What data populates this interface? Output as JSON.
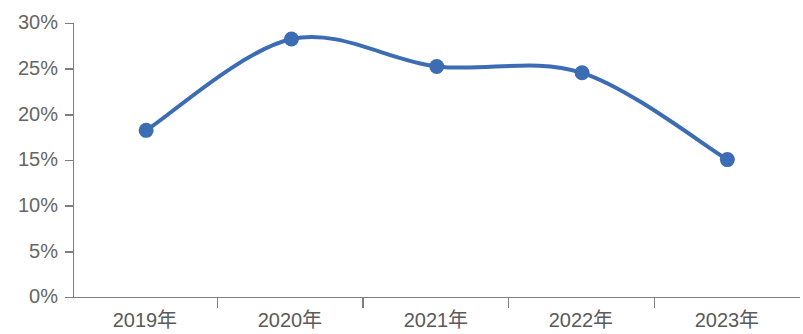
{
  "chart_data": {
    "type": "line",
    "title": "",
    "subtitle": "",
    "xlabel": "",
    "ylabel": "",
    "categories": [
      "2019年",
      "2020年",
      "2021年",
      "2022年",
      "2023年"
    ],
    "series": [
      {
        "name": "",
        "values": [
          18.3,
          28.3,
          25.3,
          24.6,
          15.1
        ]
      }
    ],
    "ylim": [
      0,
      30
    ],
    "ytick_values": [
      0,
      5,
      10,
      15,
      20,
      25,
      30
    ],
    "ytick_labels": [
      "0%",
      "5%",
      "10%",
      "15%",
      "20%",
      "25%",
      "30%"
    ],
    "grid": false,
    "legend": "none",
    "smooth": true,
    "marker": "circle",
    "colors": {
      "line": "#3b6cb4",
      "marker": "#3b6cb4",
      "axis": "#7f7f7f",
      "ytick_label": "#666666",
      "xtick_label": "#5a5a5a",
      "background": "#ffffff"
    }
  }
}
